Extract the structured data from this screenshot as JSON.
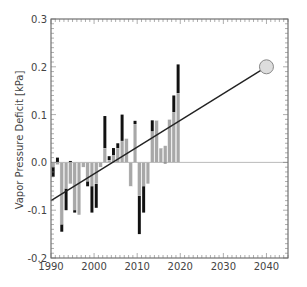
{
  "chart_data": {
    "type": "bar",
    "title": "",
    "xlabel": "",
    "ylabel": "Vapor Pressure Deficit [kPa]",
    "xlim": [
      1990,
      2045
    ],
    "ylim": [
      -0.2,
      0.3
    ],
    "x_ticks": [
      "1990",
      "2000",
      "2010",
      "2020",
      "2030",
      "2040"
    ],
    "y_ticks": [
      "-0.2",
      "-0.1",
      "0.0",
      "0.1",
      "0.2",
      "0.3"
    ],
    "grid": false,
    "legend": null,
    "categories": [
      1990,
      1991,
      1992,
      1993,
      1994,
      1995,
      1996,
      1997,
      1998,
      1999,
      2000,
      2001,
      2002,
      2003,
      2004,
      2005,
      2006,
      2007,
      2008,
      2009,
      2010,
      2011,
      2012,
      2013,
      2014,
      2015,
      2016,
      2017,
      2018,
      2019
    ],
    "series": [
      {
        "name": "series-black",
        "color": "#111111",
        "values": [
          -0.03,
          0.01,
          -0.145,
          -0.1,
          0.003,
          -0.105,
          -0.09,
          -0.005,
          -0.05,
          -0.105,
          -0.095,
          -0.005,
          0.097,
          0.013,
          0.03,
          0.04,
          0.1,
          0.03,
          -0.02,
          0.087,
          -0.15,
          -0.105,
          -0.03,
          0.088,
          0.085,
          0.02,
          -0.002,
          0.085,
          0.14,
          0.205
        ]
      },
      {
        "name": "series-gray",
        "color": "#a8a8a8",
        "values": [
          -0.01,
          -0.005,
          -0.13,
          -0.055,
          -0.045,
          -0.1,
          -0.11,
          -0.01,
          -0.04,
          -0.05,
          -0.045,
          -0.01,
          0.03,
          0.005,
          0.015,
          0.03,
          0.045,
          0.05,
          -0.05,
          0.08,
          -0.07,
          -0.05,
          -0.045,
          0.065,
          0.088,
          0.03,
          0.035,
          0.09,
          0.105,
          0.145
        ]
      }
    ],
    "trend_line": {
      "x": [
        1990,
        2040
      ],
      "y": [
        -0.08,
        0.2
      ],
      "color": "#222222"
    },
    "projection_marker": {
      "x": 2040,
      "y": 0.2,
      "shape": "circle",
      "fill": "#dddddd",
      "stroke": "#888888"
    },
    "zero_line": {
      "y": 0.0,
      "color": "#aaaaaa"
    }
  }
}
